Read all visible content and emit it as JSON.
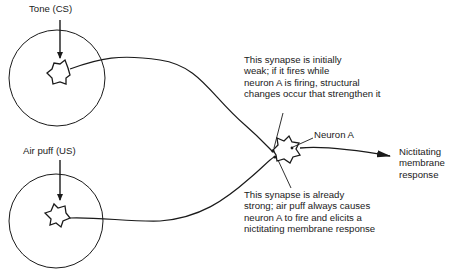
{
  "diagram": {
    "inputs": [
      {
        "label": "Tone (CS)",
        "role": "conditioned stimulus"
      },
      {
        "label": "Air puff (US)",
        "role": "unconditioned stimulus"
      }
    ],
    "target_neuron": {
      "label": "Neuron A"
    },
    "output": {
      "lines": [
        "Nictitating",
        "membrane",
        "response"
      ]
    },
    "annotations": {
      "weak_synapse": {
        "lines": [
          "This synapse is initially",
          "weak; if it fires while",
          "neuron A is firing, structural",
          "changes occur that strengthen it"
        ]
      },
      "strong_synapse": {
        "lines": [
          "This synapse is already",
          "strong; air puff always causes",
          "neuron A to fire and elicits a",
          "nictitating membrane response"
        ]
      }
    },
    "colors": {
      "line": "#1a1a1a",
      "background": "#ffffff"
    }
  }
}
